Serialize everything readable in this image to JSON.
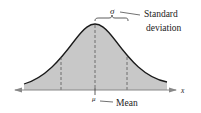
{
  "diagram": {
    "type": "normal-distribution",
    "labels": {
      "sigma": "σ",
      "std_dev_line1": "Standard",
      "std_dev_line2": "deviation",
      "mu": "μ",
      "mean": "Mean",
      "x_axis": "x"
    },
    "colors": {
      "fill": "#c8c8c8",
      "curve": "#1a1a1a",
      "axis": "#888888",
      "dashed": "#555555"
    }
  }
}
